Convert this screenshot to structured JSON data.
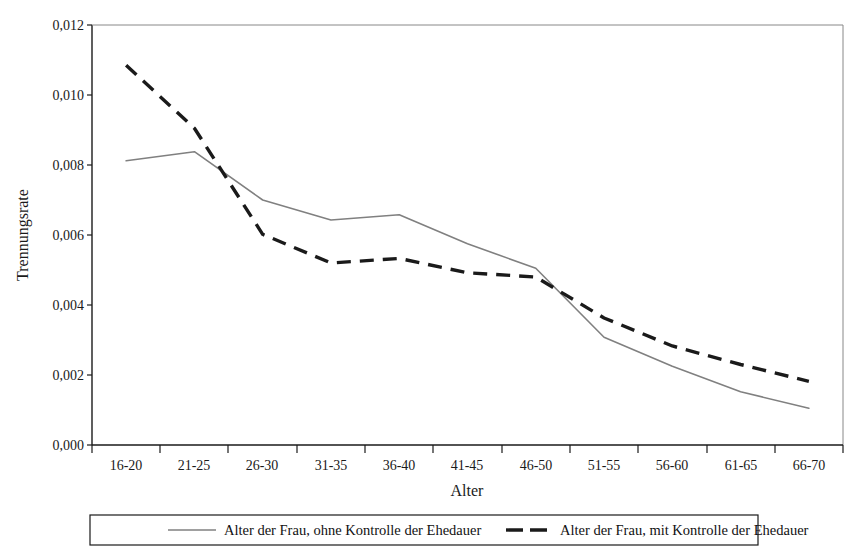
{
  "chart_data": {
    "type": "line",
    "title": "",
    "xlabel": "Alter",
    "ylabel": "Trennungsrate",
    "categories": [
      "16-20",
      "21-25",
      "26-30",
      "31-35",
      "36-40",
      "41-45",
      "46-50",
      "51-55",
      "56-60",
      "61-65",
      "66-70"
    ],
    "ylim": [
      0.0,
      0.012
    ],
    "yticks": [
      "0,000",
      "0,002",
      "0,004",
      "0,006",
      "0,008",
      "0,010",
      "0,012"
    ],
    "ytick_values": [
      0.0,
      0.002,
      0.004,
      0.006,
      0.008,
      0.01,
      0.012
    ],
    "grid": false,
    "legend_position": "bottom",
    "series": [
      {
        "name": "Alter der Frau, ohne Kontrolle der Ehedauer",
        "style": "solid",
        "color": "#808080",
        "values": [
          0.00812,
          0.00838,
          0.007,
          0.00643,
          0.00658,
          0.00575,
          0.00505,
          0.00308,
          0.00225,
          0.00152,
          0.00105
        ]
      },
      {
        "name": "Alter der Frau, mit Kontrolle der Ehedauer",
        "style": "dashed",
        "color": "#1a1a1a",
        "values": [
          0.01085,
          0.00905,
          0.00602,
          0.0052,
          0.00533,
          0.00492,
          0.0048,
          0.00363,
          0.00283,
          0.0023,
          0.00182
        ]
      }
    ]
  },
  "legend": {
    "entries": [
      {
        "label": "Alter der Frau, ohne Kontrolle der Ehedauer",
        "style": "solid",
        "color": "#808080"
      },
      {
        "label": "Alter der Frau, mit Kontrolle der Ehedauer",
        "style": "dashed",
        "color": "#1a1a1a"
      }
    ]
  },
  "axes": {
    "x_title": "Alter",
    "y_title": "Trennungsrate"
  }
}
